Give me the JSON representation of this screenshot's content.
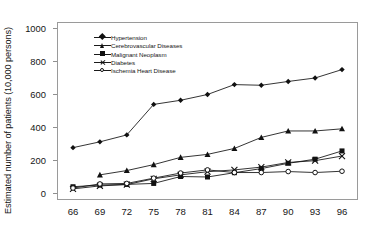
{
  "chart_data": {
    "type": "line",
    "title": "",
    "xlabel": "",
    "ylabel": "Estimated number of patients (10,000 persons)",
    "x": [
      66,
      69,
      72,
      75,
      78,
      81,
      84,
      87,
      90,
      93,
      96
    ],
    "xtick_labels": [
      "66",
      "69",
      "72",
      "75",
      "78",
      "81",
      "84",
      "87",
      "90",
      "93",
      "96"
    ],
    "ytick_labels": [
      "0",
      "200",
      "400",
      "600",
      "800",
      "1000"
    ],
    "yticks": [
      0,
      200,
      400,
      600,
      800,
      1000
    ],
    "ylim": [
      0,
      1000
    ],
    "grid": false,
    "legend_position": "upper-left-inside",
    "series": [
      {
        "name": "Hypertension",
        "marker": "filled-diamond",
        "x": [
          66,
          69,
          72,
          75,
          78,
          81,
          84,
          87,
          90,
          93,
          96
        ],
        "values": [
          275,
          310,
          352,
          537,
          562,
          597,
          657,
          653,
          676,
          697,
          748
        ]
      },
      {
        "name": "Cerebrovascular Diseases",
        "marker": "filled-triangle",
        "x": [
          69,
          72,
          75,
          78,
          81,
          84,
          87,
          90,
          93,
          96
        ],
        "values": [
          110,
          136,
          172,
          216,
          234,
          270,
          337,
          376,
          376,
          389
        ]
      },
      {
        "name": "Malignant Neoplasm",
        "marker": "filled-square",
        "x": [
          66,
          69,
          72,
          75,
          78,
          81,
          84,
          87,
          90,
          93,
          96
        ],
        "values": [
          38,
          48,
          52,
          58,
          100,
          97,
          123,
          148,
          180,
          205,
          255
        ]
      },
      {
        "name": "Diabetes",
        "marker": "x-cross",
        "x": [
          66,
          69,
          72,
          75,
          78,
          81,
          84,
          87,
          90,
          93,
          96
        ],
        "values": [
          25,
          43,
          51,
          86,
          110,
          129,
          140,
          157,
          185,
          196,
          224
        ]
      },
      {
        "name": "Ischemia Heart Disease",
        "marker": "open-circle",
        "x": [
          66,
          69,
          72,
          75,
          78,
          81,
          84,
          87,
          90,
          93,
          96
        ],
        "values": [
          30,
          55,
          58,
          90,
          121,
          140,
          124,
          124,
          130,
          124,
          132
        ]
      }
    ]
  },
  "legend": {
    "items": [
      {
        "label": "Hypertension",
        "marker": "filled-diamond"
      },
      {
        "label": "Cerebrovascular Diseases",
        "marker": "filled-triangle"
      },
      {
        "label": "Malignant Neoplasm",
        "marker": "filled-square"
      },
      {
        "label": "Diabetes",
        "marker": "x-cross"
      },
      {
        "label": "Ischemia Heart Disease",
        "marker": "open-circle"
      }
    ]
  },
  "colors": {
    "line": "#111111",
    "axis": "#9a9a9a",
    "text": "#161616",
    "background": "#ffffff"
  }
}
